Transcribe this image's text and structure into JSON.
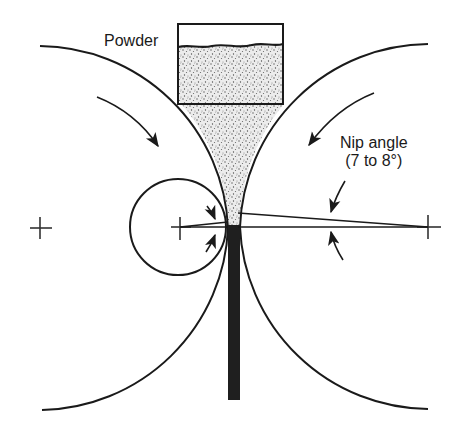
{
  "diagram": {
    "labels": {
      "powder": "Powder",
      "nip_angle_line1": "Nip angle",
      "nip_angle_line2": "(7 to 8°)"
    },
    "components": [
      {
        "name": "powder-hopper",
        "description": "Rectangular hopper filled with stippled powder feeding down into the roll gap"
      },
      {
        "name": "left-roll",
        "description": "Large roll arc, center marked with crosshair on left, rotating clockwise"
      },
      {
        "name": "right-roll",
        "description": "Large roll arc, center marked with crosshair on right, rotating counter-clockwise"
      },
      {
        "name": "detail-circle",
        "description": "Small circle highlighting the nip region with paired arrows"
      },
      {
        "name": "compacted-strip",
        "description": "Dark vertical strip exiting below the roll gap"
      },
      {
        "name": "nip-angle-lines",
        "description": "Two lines from right roll center bounding the nip angle, with opposing arrows"
      }
    ],
    "nip_angle_range_deg": [
      7,
      8
    ],
    "colors": {
      "line": "#1a1a1a",
      "strip": "#1f1f1f",
      "powder_fill": "#e6e6e6",
      "powder_dots": "#5a5a5a",
      "background": "#ffffff"
    }
  }
}
